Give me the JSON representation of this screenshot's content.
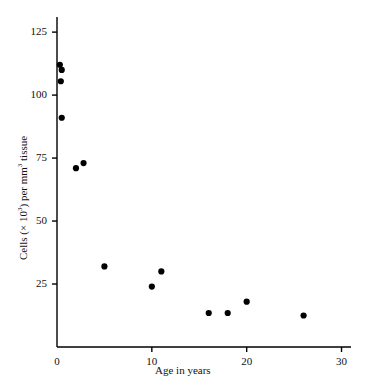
{
  "chart_data": {
    "type": "scatter",
    "title": "",
    "subtitle": "",
    "xlabel": "Age in years",
    "ylabel": "Cells (× 10³) per mm³ tissue",
    "ylabel_parts": {
      "prefix": "Cells (× 10",
      "exp1": "3",
      "middle": ") per mm",
      "exp2": "3",
      "suffix": " tissue"
    },
    "xlim": [
      0,
      31
    ],
    "ylim": [
      0,
      131
    ],
    "xticks": [
      0,
      10,
      20,
      30
    ],
    "xtick_labels": [
      "0",
      "10",
      "20",
      "30"
    ],
    "yticks": [
      25,
      50,
      75,
      100,
      125
    ],
    "ytick_labels": [
      "25",
      "50",
      "75",
      "100",
      "125"
    ],
    "grid": false,
    "legend": false,
    "legend_position": "none",
    "marker": "filled-circle",
    "marker_color": "#000000",
    "marker_size_px": 5,
    "axis_color": "#000000",
    "background_color": "#ffffff",
    "series": [
      {
        "name": "Cell density vs age",
        "points": [
          {
            "x": 0.3,
            "y": 112
          },
          {
            "x": 0.5,
            "y": 110
          },
          {
            "x": 0.4,
            "y": 105.5
          },
          {
            "x": 0.5,
            "y": 91
          },
          {
            "x": 2.0,
            "y": 71
          },
          {
            "x": 2.8,
            "y": 73
          },
          {
            "x": 5.0,
            "y": 32
          },
          {
            "x": 10.0,
            "y": 24
          },
          {
            "x": 11.0,
            "y": 30
          },
          {
            "x": 16.0,
            "y": 13.5
          },
          {
            "x": 18.0,
            "y": 13.5
          },
          {
            "x": 20.0,
            "y": 18
          },
          {
            "x": 26.0,
            "y": 12.5
          }
        ]
      }
    ]
  }
}
